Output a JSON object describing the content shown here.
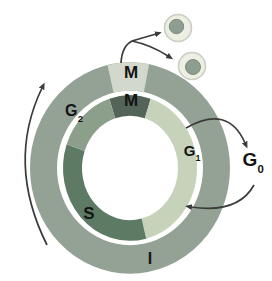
{
  "diagram": {
    "name": "cell-cycle-diagram",
    "background": "#ffffff",
    "center": {
      "x": 130,
      "y": 168
    },
    "outer_ring": {
      "radius": 86.5,
      "width": 27,
      "scale_y": 1.058,
      "interphase_color": "#93a294",
      "segments": [
        {
          "name": "M",
          "start": -13,
          "end": 11,
          "color": "#d3d8cd"
        }
      ]
    },
    "inner_ring": {
      "radius": 57.5,
      "width": 19,
      "scale_y": 1.087,
      "segments": [
        {
          "name": "M",
          "start": 342,
          "end": 378,
          "color": "#546458"
        },
        {
          "name": "G1",
          "start": 18,
          "end": 166,
          "color": "#c6d3ba"
        },
        {
          "name": "S",
          "start": 166,
          "end": 289,
          "color": "#5c7a64"
        },
        {
          "name": "G2",
          "start": 289,
          "end": 342,
          "color": "#8b9f8b"
        }
      ]
    },
    "labels": {
      "m_outer": {
        "text": "M",
        "x": 131,
        "y": 72
      },
      "m_inner": {
        "text": "M",
        "x": 131,
        "y": 100
      },
      "g2": {
        "main": "G",
        "sub": "2",
        "x": 74,
        "y": 112
      },
      "g1": {
        "main": "G",
        "sub": "1",
        "x": 192,
        "y": 152
      },
      "g0": {
        "main": "G",
        "sub": "0",
        "x": 253,
        "y": 162
      },
      "s": {
        "text": "S",
        "x": 89,
        "y": 213
      },
      "i": {
        "text": "I",
        "x": 150,
        "y": 259
      }
    },
    "arrows": {
      "color": "#3b3b3b",
      "stroke_width": 1.7,
      "items": [
        {
          "name": "cycle-direction-arrow",
          "path": "M 47 245 Q 6 163 42 88"
        },
        {
          "name": "division-arrow-a",
          "path": "M 121 63 Q 122 46 132 41 L 156 34"
        },
        {
          "name": "division-arrow-b",
          "path": "M 132 41 Q 151 45 168 56"
        },
        {
          "name": "g1-to-g0-arrow",
          "path": "M 186 128 Q 228 104 245 143"
        },
        {
          "name": "g0-to-g1-arrow",
          "path": "M 254 185 Q 238 214 191 207"
        }
      ]
    },
    "daughter_cells": {
      "body_fill": "#edefe4",
      "body_stroke": "#c8cec0",
      "nucleus_fill": "#8d9d90",
      "nucleus_stroke": "#7b8c7e",
      "items": [
        {
          "name": "daughter-cell-1",
          "cx": 178,
          "cy": 28,
          "r": 13.5,
          "nucleus": {
            "cx": 176.5,
            "cy": 26.5,
            "r": 7.2
          }
        },
        {
          "name": "daughter-cell-2",
          "cx": 192,
          "cy": 66,
          "r": 13.5,
          "nucleus": {
            "cx": 193,
            "cy": 67,
            "r": 7.5
          }
        }
      ]
    }
  }
}
